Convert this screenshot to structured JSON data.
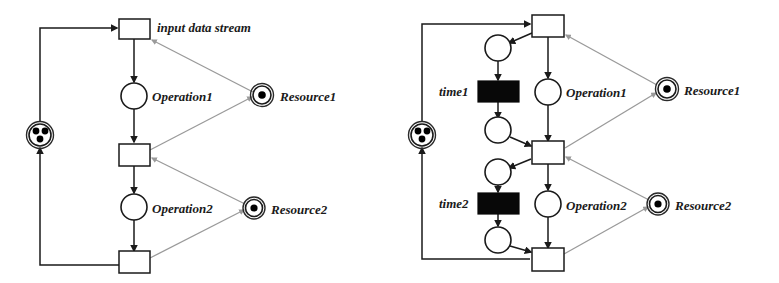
{
  "figure": {
    "type": "petri-net-pair",
    "background": "#ffffff",
    "ink_color": "#1a1a1a",
    "resource_arc_color": "#9a9a9a",
    "token_color": "#000000",
    "solid_transition_color": "#080808"
  },
  "left_net": {
    "name": "untimed-petri-net",
    "labels": {
      "input_stream": "input data stream",
      "operation1": "Operation1",
      "operation2": "Operation2",
      "resource1": "Resource1",
      "resource2": "Resource2"
    },
    "places": [
      {
        "id": "buffer",
        "label": "",
        "tokens": 3,
        "kind": "double-circle"
      },
      {
        "id": "operation1",
        "label": "Operation1",
        "tokens": 0,
        "kind": "circle"
      },
      {
        "id": "operation2",
        "label": "Operation2",
        "tokens": 0,
        "kind": "circle"
      },
      {
        "id": "resource1",
        "label": "Resource1",
        "tokens": 1,
        "kind": "double-circle"
      },
      {
        "id": "resource2",
        "label": "Resource2",
        "tokens": 1,
        "kind": "double-circle"
      }
    ],
    "transitions": [
      {
        "id": "t1",
        "label": "input data stream",
        "kind": "open"
      },
      {
        "id": "t2",
        "label": "",
        "kind": "open"
      },
      {
        "id": "t3",
        "label": "",
        "kind": "open"
      }
    ]
  },
  "right_net": {
    "name": "timed-petri-net",
    "labels": {
      "time1": "time1",
      "time2": "time2",
      "operation1": "Operation1",
      "operation2": "Operation2",
      "resource1": "Resource1",
      "resource2": "Resource2"
    },
    "places": [
      {
        "id": "buffer",
        "label": "",
        "tokens": 3,
        "kind": "double-circle"
      },
      {
        "id": "pre-time1",
        "label": "",
        "tokens": 0,
        "kind": "circle"
      },
      {
        "id": "post-time1",
        "label": "",
        "tokens": 0,
        "kind": "circle"
      },
      {
        "id": "operation1",
        "label": "Operation1",
        "tokens": 0,
        "kind": "circle"
      },
      {
        "id": "pre-time2",
        "label": "",
        "tokens": 0,
        "kind": "circle"
      },
      {
        "id": "post-time2",
        "label": "",
        "tokens": 0,
        "kind": "circle"
      },
      {
        "id": "operation2",
        "label": "Operation2",
        "tokens": 0,
        "kind": "circle"
      },
      {
        "id": "resource1",
        "label": "Resource1",
        "tokens": 1,
        "kind": "double-circle"
      },
      {
        "id": "resource2",
        "label": "Resource2",
        "tokens": 1,
        "kind": "double-circle"
      }
    ],
    "transitions": [
      {
        "id": "t1",
        "label": "",
        "kind": "open"
      },
      {
        "id": "time1",
        "label": "time1",
        "kind": "solid"
      },
      {
        "id": "t2",
        "label": "",
        "kind": "open"
      },
      {
        "id": "time2",
        "label": "time2",
        "kind": "solid"
      },
      {
        "id": "t3",
        "label": "",
        "kind": "open"
      }
    ]
  }
}
